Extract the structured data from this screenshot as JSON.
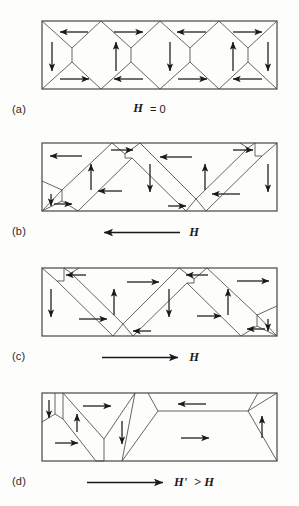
{
  "figure": {
    "background_color": "#fdfdfc",
    "line_color": "#4a4a4a",
    "arrow_color": "#1a1a1a",
    "border_color": "#555555"
  },
  "panels": [
    {
      "id": "a",
      "label": "(a)",
      "caption_symbol": "H",
      "caption_relation": "= 0",
      "caption_full": "H = 0",
      "field_arrow": "none",
      "state": "demagnetized closure domains, zero net magnetization"
    },
    {
      "id": "b",
      "label": "(b)",
      "caption_symbol": "H",
      "caption_relation": "",
      "caption_full": "H",
      "field_arrow": "left",
      "state": "domain walls displaced, net magnetization toward the left"
    },
    {
      "id": "c",
      "label": "(c)",
      "caption_symbol": "H",
      "caption_relation": "",
      "caption_full": "H",
      "field_arrow": "right",
      "state": "domain walls displaced, net magnetization toward the right"
    },
    {
      "id": "d",
      "label": "(d)",
      "caption_symbol": "H'",
      "caption_relation": "> H",
      "caption_full": "H' > H",
      "field_arrow": "right",
      "state": "strong field, favorably oriented domain grows toward saturation"
    }
  ]
}
